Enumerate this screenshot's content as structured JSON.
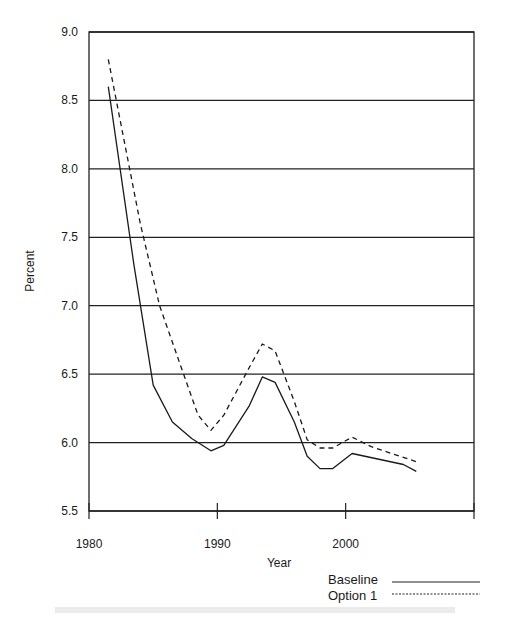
{
  "chart_data": {
    "type": "line",
    "title": "",
    "xlabel": "Year",
    "ylabel": "Percent",
    "xlim": [
      1980,
      2010
    ],
    "ylim": [
      5.5,
      9.0
    ],
    "x_ticks": [
      1980,
      1990,
      2000,
      2010
    ],
    "x_tick_labels": [
      "1980",
      "1990",
      "2000"
    ],
    "y_ticks": [
      5.5,
      6.0,
      6.5,
      7.0,
      7.5,
      8.0,
      8.5,
      9.0
    ],
    "y_tick_labels": [
      "5.5",
      "6.0",
      "6.5",
      "7.0",
      "7.5",
      "8.0",
      "8.5",
      "9.0"
    ],
    "grid": "horizontal",
    "legend_position": "bottom-right",
    "series": [
      {
        "name": "Baseline",
        "style": "solid",
        "x": [
          1981.5,
          1983.5,
          1985.0,
          1986.5,
          1988.0,
          1989.5,
          1990.5,
          1992.5,
          1993.5,
          1994.5,
          1996.0,
          1997.0,
          1998.0,
          1999.0,
          2000.5,
          2004.5,
          2005.5
        ],
        "values": [
          8.6,
          7.3,
          6.42,
          6.15,
          6.03,
          5.94,
          5.98,
          6.27,
          6.48,
          6.44,
          6.15,
          5.9,
          5.81,
          5.81,
          5.92,
          5.84,
          5.79
        ]
      },
      {
        "name": "Option 1",
        "style": "dashed",
        "x": [
          1981.5,
          1984.0,
          1985.5,
          1987.0,
          1988.5,
          1989.5,
          1990.5,
          1992.5,
          1993.5,
          1994.5,
          1996.0,
          1997.0,
          1998.0,
          1999.0,
          2000.5,
          2002.0,
          2005.5
        ],
        "values": [
          8.8,
          7.6,
          7.0,
          6.6,
          6.2,
          6.09,
          6.2,
          6.55,
          6.72,
          6.67,
          6.3,
          6.02,
          5.96,
          5.96,
          6.04,
          5.97,
          5.86
        ]
      }
    ]
  },
  "labels": {
    "ylabel": "Percent",
    "xlabel": "Year",
    "legend_baseline": "Baseline",
    "legend_option": "Option 1"
  }
}
